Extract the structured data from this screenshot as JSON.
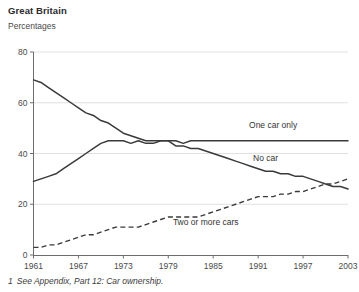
{
  "header": {
    "title": "Great Britain",
    "subtitle": "Percentages"
  },
  "footnote": {
    "marker": "1",
    "text": "See Appendix, Part 12: Car ownership."
  },
  "chart_data": {
    "type": "line",
    "title": "Great Britain",
    "subtitle": "Percentages",
    "xlabel": "",
    "ylabel": "Percentages",
    "ylim": [
      0,
      80
    ],
    "xlim": [
      1961,
      2003
    ],
    "yticks": [
      0,
      20,
      40,
      60,
      80
    ],
    "xticks": [
      1961,
      1967,
      1973,
      1979,
      1985,
      1991,
      1997,
      2003
    ],
    "grid": true,
    "legend_position": "inline-labels",
    "x": [
      1961,
      1962,
      1963,
      1964,
      1965,
      1966,
      1967,
      1968,
      1969,
      1970,
      1971,
      1972,
      1973,
      1974,
      1975,
      1976,
      1977,
      1978,
      1979,
      1980,
      1981,
      1982,
      1983,
      1984,
      1985,
      1986,
      1987,
      1988,
      1989,
      1990,
      1991,
      1992,
      1993,
      1994,
      1995,
      1996,
      1997,
      1998,
      1999,
      2000,
      2001,
      2002,
      2003
    ],
    "series": [
      {
        "name": "No car",
        "style": "solid",
        "label": "No car",
        "values": [
          69,
          68,
          66,
          64,
          62,
          60,
          58,
          56,
          55,
          53,
          52,
          50,
          48,
          47,
          46,
          45,
          45,
          45,
          45,
          43,
          43,
          42,
          42,
          41,
          40,
          39,
          38,
          37,
          36,
          35,
          34,
          33,
          33,
          32,
          32,
          31,
          31,
          30,
          29,
          28,
          27,
          27,
          26
        ]
      },
      {
        "name": "One car only",
        "style": "solid",
        "label": "One car only",
        "values": [
          29,
          30,
          31,
          32,
          34,
          36,
          38,
          40,
          42,
          44,
          45,
          45,
          45,
          44,
          45,
          44,
          44,
          45,
          45,
          45,
          44,
          45,
          45,
          45,
          45,
          45,
          45,
          45,
          45,
          45,
          45,
          45,
          45,
          45,
          45,
          45,
          45,
          45,
          45,
          45,
          45,
          45,
          45
        ]
      },
      {
        "name": "Two or more cars",
        "style": "dashed",
        "label": "Two or more cars",
        "values": [
          3,
          3,
          4,
          4,
          5,
          6,
          7,
          8,
          8,
          9,
          10,
          11,
          11,
          11,
          11,
          12,
          13,
          14,
          15,
          15,
          15,
          15,
          15,
          16,
          17,
          18,
          19,
          20,
          21,
          22,
          23,
          23,
          23,
          24,
          24,
          25,
          25,
          26,
          27,
          28,
          28,
          29,
          30
        ]
      }
    ],
    "annotations": [
      {
        "text": "One car only",
        "x": 1993,
        "y": 50
      },
      {
        "text": "No car",
        "x": 1992,
        "y": 37
      },
      {
        "text": "Two or more cars",
        "x": 1984,
        "y": 12
      }
    ]
  }
}
